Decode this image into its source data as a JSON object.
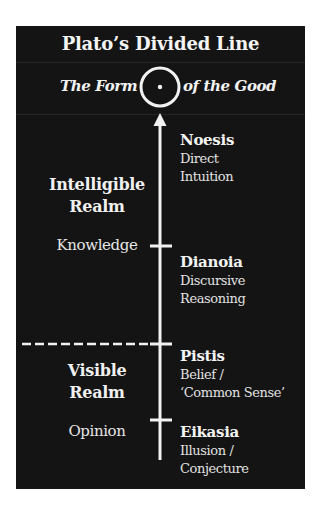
{
  "diagram": {
    "title": "Plato’s Divided Line",
    "top": {
      "left_label": "The Form",
      "right_label": "of the Good",
      "icon": "sun-circle-icon"
    },
    "realms": [
      {
        "id": "intelligible",
        "label_line1": "Intelligible",
        "label_line2": "Realm",
        "state": "Knowledge"
      },
      {
        "id": "visible",
        "label_line1": "Visible",
        "label_line2": "Realm",
        "state": "Opinion"
      }
    ],
    "segments": [
      {
        "name": "Noesis",
        "desc_line1": "Direct",
        "desc_line2": "Intuition"
      },
      {
        "name": "Dianoia",
        "desc_line1": "Discursive",
        "desc_line2": "Reasoning"
      },
      {
        "name": "Pistis",
        "desc_line1": "Belief /",
        "desc_line2": "‘Common Sense’"
      },
      {
        "name": "Eikasia",
        "desc_line1": "Illusion /",
        "desc_line2": "Conjecture"
      }
    ],
    "colors": {
      "background": "#141414",
      "foreground": "#f2f2f2",
      "page": "#ffffff"
    }
  }
}
